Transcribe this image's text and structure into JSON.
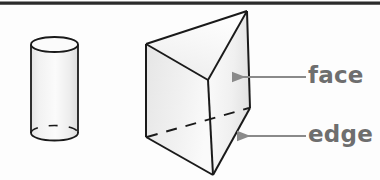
{
  "figure": {
    "background_color": "#fdfdfd",
    "top_rule": {
      "name": "top-horizontal-rule",
      "color": "#2b2b2b"
    },
    "shapes": [
      {
        "name": "cylinder",
        "kind": "cylinder",
        "outline_color": "#1a1a1a",
        "fill_color": "#f2f2f2",
        "hidden_edge_style": "dashed",
        "top_ellipse": {
          "cx": 54.5,
          "cy": 44.5,
          "rx": 23.5,
          "ry": 7.5
        },
        "bottom_ellipse": {
          "cx": 54.5,
          "cy": 133.0,
          "rx": 23.5,
          "ry": 7.5
        },
        "body_top_y": 44.5,
        "body_bottom_y": 133.0
      },
      {
        "name": "triangular-prism",
        "kind": "triangular prism",
        "outline_color": "#1a1a1a",
        "fill_color_left": "#eeeeee",
        "fill_color_top": "#f6f6f6",
        "fill_color_right": "#f4f4f4",
        "hidden_edge_style": "dashed",
        "vertices": {
          "back_top_left": {
            "x": 146,
            "y": 44
          },
          "apex_top_right": {
            "x": 247,
            "y": 11
          },
          "front_top": {
            "x": 208,
            "y": 80
          },
          "back_bottom_left": {
            "x": 146,
            "y": 137
          },
          "right_bottom": {
            "x": 250,
            "y": 108
          },
          "front_bottom": {
            "x": 213,
            "y": 175
          }
        }
      }
    ],
    "callouts": [
      {
        "name": "callout-face",
        "label": "face",
        "label_color": "#6e6e6e",
        "arrow_color": "#8a8a8a",
        "arrow": {
          "from_x": 306,
          "from_y": 77,
          "to_x": 231,
          "to_y": 77
        },
        "points_to": "face"
      },
      {
        "name": "callout-edge",
        "label": "edge",
        "label_color": "#6e6e6e",
        "arrow_color": "#8a8a8a",
        "arrow": {
          "from_x": 306,
          "from_y": 136,
          "to_x": 236,
          "to_y": 136
        },
        "points_to": "edge"
      }
    ]
  }
}
